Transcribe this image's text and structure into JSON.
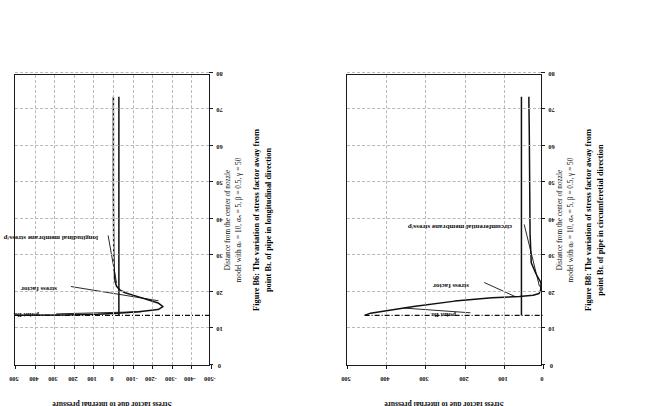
{
  "page": {
    "background": "#ffffff",
    "ink": "#111111",
    "grid_color": "#b9b9b9",
    "orientation": "rotated-90-ccw"
  },
  "figures": [
    {
      "id": "figure-b6",
      "chart_data": {
        "type": "line",
        "title": "",
        "xlabel_lines": [
          "Distance from the center of nozzle",
          "model with αₚ = 10, αₙ = 5, β = 0.5, γ = 50"
        ],
        "ylabel": "Stress factor due to internal pressure",
        "xlim": [
          0,
          80
        ],
        "ylim": [
          -500,
          500
        ],
        "xticks": [
          0,
          10,
          20,
          30,
          40,
          50,
          60,
          70,
          80
        ],
        "yticks": [
          -500,
          -400,
          -300,
          -200,
          -100,
          0,
          100,
          200,
          300,
          400,
          500
        ],
        "xticklabels": [
          "0",
          "10",
          "20",
          "30",
          "40",
          "50",
          "60",
          "70",
          "80"
        ],
        "yticklabels": [
          "-500",
          "-400",
          "-300",
          "-200",
          "-100",
          "0",
          "100",
          "200",
          "300",
          "400",
          "500"
        ],
        "grid": true,
        "legend": "none",
        "annotations": [
          {
            "label": "point Bʟ",
            "x": 14,
            "y": 340
          },
          {
            "label": "stress factor",
            "x": 21,
            "y": 250
          },
          {
            "label": "longitudinal membrane stress/p",
            "x": 35,
            "y": 40
          }
        ],
        "series": [
          {
            "name": "stress factor",
            "points": [
              [
                13.6,
                500
              ],
              [
                13.7,
                250
              ],
              [
                13.9,
                80
              ],
              [
                14.1,
                0
              ],
              [
                14.3,
                -60
              ],
              [
                14.6,
                -130
              ],
              [
                15.2,
                -230
              ],
              [
                16.0,
                -255
              ],
              [
                17.0,
                -230
              ],
              [
                18.0,
                -170
              ],
              [
                19.0,
                -110
              ],
              [
                19.8,
                -62
              ],
              [
                20.6,
                -34
              ],
              [
                21.6,
                -18
              ],
              [
                23.0,
                -10
              ],
              [
                26.0,
                -6
              ],
              [
                31.0,
                -4
              ],
              [
                38.0,
                -3
              ],
              [
                48.0,
                -2
              ],
              [
                60.0,
                -2
              ],
              [
                72.0,
                -2
              ],
              [
                73.5,
                -2
              ]
            ]
          },
          {
            "name": "longitudinal membrane stress/p",
            "points": [
              [
                13.6,
                -30
              ],
              [
                20,
                -30
              ],
              [
                30,
                -30
              ],
              [
                40,
                -30
              ],
              [
                50,
                -30
              ],
              [
                60,
                -30
              ],
              [
                70,
                -30
              ],
              [
                73.5,
                -30
              ]
            ]
          },
          {
            "name": "point-BL marker",
            "points": [
              [
                13.6,
                500
              ],
              [
                13.6,
                -500
              ]
            ]
          }
        ]
      },
      "caption": {
        "bold_lines": [
          "Figure B6: The variation of stress factor away from",
          "point Bʟ of pipe in longitudinal direction"
        ]
      }
    },
    {
      "id": "figure-b8",
      "chart_data": {
        "type": "line",
        "title": "",
        "xlabel_lines": [
          "Distance from the center of nozzle",
          "model with αₚ = 10, αₙ = 5, β = 0.5, γ = 50"
        ],
        "ylabel": "Stress factor due to internal pressure",
        "xlim": [
          0,
          80
        ],
        "ylim": [
          0,
          500
        ],
        "xticks": [
          0,
          10,
          20,
          30,
          40,
          50,
          60,
          70,
          80
        ],
        "yticks": [
          0,
          100,
          200,
          300,
          400,
          500
        ],
        "xticklabels": [
          "0",
          "10",
          "20",
          "30",
          "40",
          "50",
          "60",
          "70",
          "80"
        ],
        "yticklabels": [
          "0",
          "100",
          "200",
          "300",
          "400",
          "500"
        ],
        "grid": true,
        "legend": "none",
        "annotations": [
          {
            "label": "point Bʟ",
            "x": 14,
            "y": 205
          },
          {
            "label": "stress factor",
            "x": 22,
            "y": 170
          },
          {
            "label": "circumferential membrane stress/p",
            "x": 38,
            "y": 60
          }
        ],
        "series": [
          {
            "name": "stress factor",
            "points": [
              [
                13.6,
                455
              ],
              [
                14.2,
                440
              ],
              [
                16.0,
                330
              ],
              [
                17.5,
                225
              ],
              [
                18.4,
                130
              ],
              [
                18.8,
                60
              ],
              [
                19.1,
                25
              ],
              [
                19.6,
                10
              ],
              [
                20.5,
                6
              ],
              [
                22.5,
                5
              ],
              [
                25.0,
                18
              ],
              [
                28.0,
                30
              ],
              [
                36.0,
                33
              ],
              [
                50.0,
                34
              ],
              [
                64.0,
                35
              ],
              [
                72.0,
                36
              ],
              [
                73.5,
                36
              ]
            ]
          },
          {
            "name": "circumferential membrane stress/p",
            "points": [
              [
                13.6,
                55
              ],
              [
                25,
                55
              ],
              [
                38,
                55
              ],
              [
                50,
                55
              ],
              [
                62,
                55
              ],
              [
                72,
                55
              ],
              [
                73.5,
                55
              ]
            ]
          },
          {
            "name": "point-BL marker",
            "points": [
              [
                13.6,
                455
              ],
              [
                13.6,
                0
              ]
            ]
          }
        ]
      },
      "caption": {
        "bold_lines": [
          "Figure B8: The variation of stress factor away from",
          "point Bʟ of pipe in circumferetial direction"
        ]
      }
    }
  ]
}
